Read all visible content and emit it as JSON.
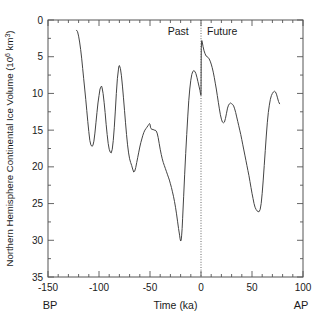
{
  "figure": {
    "name": "northern-hemisphere-ice-volume-figure",
    "background": "#ffffff",
    "line_color": "#444444",
    "axis_color": "#555555"
  },
  "chart_data": {
    "type": "line",
    "title": "",
    "subtitle": "",
    "xlabel": "Time (ka)",
    "ylabel": "Northern Hemisphere Continental Ice Volume (10⁶ km³)",
    "ylabel_base": "Northern Hemisphere Continental Ice Volume (10",
    "ylabel_exp": "6",
    "ylabel_tail": " km",
    "ylabel_exp2": "3",
    "ylabel_close": ")",
    "xlim": [
      -150,
      100
    ],
    "ylim": [
      35,
      0
    ],
    "y_inverted": true,
    "grid": false,
    "legend": null,
    "xticks": [
      -150,
      -100,
      -50,
      0,
      50,
      100
    ],
    "xtick_labels": [
      "-150",
      "-100",
      "-50",
      "0",
      "50",
      "100"
    ],
    "x_minor_step": 10,
    "yticks": [
      0,
      5,
      10,
      15,
      20,
      25,
      30,
      35
    ],
    "ytick_labels": [
      "0",
      "5",
      "10",
      "15",
      "20",
      "25",
      "30",
      "35"
    ],
    "y_minor_step": 2.5,
    "annotations": [
      {
        "name": "past-label",
        "text": "Past",
        "x": -12,
        "y": 1.5,
        "anchor": "end"
      },
      {
        "name": "future-label",
        "text": "Future",
        "x": 6,
        "y": 1.5,
        "anchor": "start"
      },
      {
        "name": "bp-label",
        "text": "BP",
        "x": -150,
        "y": null,
        "anchor": "middle"
      },
      {
        "name": "ap-label",
        "text": "AP",
        "x": 100,
        "y": null,
        "anchor": "middle"
      }
    ],
    "reference_lines": [
      {
        "name": "present-day-divider",
        "orientation": "vertical",
        "x": 0,
        "style": "dotted"
      }
    ],
    "corner_labels": {
      "left": "BP",
      "right": "AP"
    },
    "era_labels": {
      "past": "Past",
      "future": "Future"
    },
    "series": [
      {
        "name": "Northern Hemisphere continental ice volume",
        "segment": "past",
        "points": [
          [
            -122.0,
            1.4
          ],
          [
            -121.0,
            1.6
          ],
          [
            -120.0,
            2.2
          ],
          [
            -119.0,
            3.0
          ],
          [
            -118.0,
            4.0
          ],
          [
            -117.0,
            5.2
          ],
          [
            -116.0,
            6.6
          ],
          [
            -115.0,
            8.0
          ],
          [
            -114.0,
            9.4
          ],
          [
            -113.0,
            10.8
          ],
          [
            -112.0,
            12.3
          ],
          [
            -111.0,
            13.8
          ],
          [
            -110.0,
            15.2
          ],
          [
            -109.0,
            16.4
          ],
          [
            -108.0,
            17.0
          ],
          [
            -107.0,
            17.2
          ],
          [
            -106.0,
            17.1
          ],
          [
            -105.0,
            16.5
          ],
          [
            -104.0,
            15.4
          ],
          [
            -103.0,
            14.0
          ],
          [
            -102.0,
            12.6
          ],
          [
            -101.0,
            11.3
          ],
          [
            -100.0,
            10.3
          ],
          [
            -99.0,
            9.4
          ],
          [
            -98.0,
            9.1
          ],
          [
            -97.5,
            9.0
          ],
          [
            -97.0,
            9.2
          ],
          [
            -96.0,
            10.0
          ],
          [
            -95.0,
            11.2
          ],
          [
            -94.0,
            12.6
          ],
          [
            -93.0,
            14.2
          ],
          [
            -92.0,
            15.6
          ],
          [
            -91.0,
            16.8
          ],
          [
            -90.0,
            17.6
          ],
          [
            -89.0,
            18.0
          ],
          [
            -88.0,
            18.1
          ],
          [
            -87.0,
            17.6
          ],
          [
            -86.0,
            16.4
          ],
          [
            -85.0,
            14.6
          ],
          [
            -84.0,
            12.4
          ],
          [
            -83.0,
            10.0
          ],
          [
            -82.0,
            8.0
          ],
          [
            -81.0,
            6.8
          ],
          [
            -80.5,
            6.3
          ],
          [
            -80.0,
            6.2
          ],
          [
            -79.0,
            6.6
          ],
          [
            -78.0,
            7.6
          ],
          [
            -77.0,
            9.0
          ],
          [
            -76.0,
            10.6
          ],
          [
            -75.0,
            12.3
          ],
          [
            -74.0,
            14.0
          ],
          [
            -73.0,
            15.6
          ],
          [
            -72.0,
            17.0
          ],
          [
            -71.0,
            18.1
          ],
          [
            -70.0,
            18.9
          ],
          [
            -69.0,
            19.4
          ],
          [
            -68.0,
            19.8
          ],
          [
            -67.0,
            20.3
          ],
          [
            -66.0,
            20.7
          ],
          [
            -65.0,
            20.6
          ],
          [
            -64.0,
            20.1
          ],
          [
            -63.0,
            19.4
          ],
          [
            -62.0,
            18.7
          ],
          [
            -61.0,
            18.0
          ],
          [
            -60.0,
            17.3
          ],
          [
            -59.0,
            16.7
          ],
          [
            -58.0,
            16.2
          ],
          [
            -57.0,
            15.7
          ],
          [
            -56.0,
            15.3
          ],
          [
            -55.0,
            15.0
          ],
          [
            -54.0,
            14.8
          ],
          [
            -53.0,
            14.6
          ],
          [
            -52.0,
            14.4
          ],
          [
            -51.0,
            14.2
          ],
          [
            -50.5,
            14.1
          ],
          [
            -50.0,
            14.2
          ],
          [
            -49.5,
            14.6
          ],
          [
            -49.0,
            14.8
          ],
          [
            -48.0,
            14.9
          ],
          [
            -47.0,
            14.9
          ],
          [
            -46.0,
            15.0
          ],
          [
            -45.0,
            15.0
          ],
          [
            -44.0,
            15.1
          ],
          [
            -43.0,
            15.4
          ],
          [
            -42.0,
            16.0
          ],
          [
            -41.0,
            16.8
          ],
          [
            -40.0,
            17.6
          ],
          [
            -39.0,
            18.3
          ],
          [
            -38.0,
            18.9
          ],
          [
            -37.0,
            19.4
          ],
          [
            -36.0,
            19.8
          ],
          [
            -35.0,
            20.2
          ],
          [
            -34.0,
            20.6
          ],
          [
            -33.0,
            21.0
          ],
          [
            -32.0,
            21.4
          ],
          [
            -31.0,
            21.8
          ],
          [
            -30.0,
            22.3
          ],
          [
            -29.0,
            22.8
          ],
          [
            -28.0,
            23.4
          ],
          [
            -27.0,
            24.0
          ],
          [
            -26.0,
            24.7
          ],
          [
            -25.0,
            25.5
          ],
          [
            -24.0,
            26.4
          ],
          [
            -23.0,
            27.4
          ],
          [
            -22.0,
            28.4
          ],
          [
            -21.0,
            29.3
          ],
          [
            -20.5,
            29.8
          ],
          [
            -20.0,
            30.1
          ],
          [
            -19.5,
            30.0
          ],
          [
            -19.0,
            29.4
          ],
          [
            -18.5,
            28.4
          ],
          [
            -18.0,
            27.0
          ],
          [
            -17.0,
            24.0
          ],
          [
            -16.0,
            21.0
          ],
          [
            -15.0,
            18.2
          ],
          [
            -14.0,
            15.6
          ],
          [
            -13.0,
            13.2
          ],
          [
            -12.0,
            11.0
          ],
          [
            -11.0,
            9.4
          ],
          [
            -10.0,
            8.2
          ],
          [
            -9.0,
            7.4
          ],
          [
            -8.0,
            7.0
          ],
          [
            -7.0,
            6.9
          ],
          [
            -6.0,
            7.0
          ],
          [
            -5.0,
            7.3
          ],
          [
            -4.0,
            7.8
          ],
          [
            -3.0,
            8.4
          ],
          [
            -2.0,
            9.0
          ],
          [
            -1.0,
            9.6
          ],
          [
            -0.4,
            10.1
          ],
          [
            -0.2,
            10.2
          ]
        ]
      },
      {
        "name": "Northern Hemisphere continental ice volume",
        "segment": "future",
        "points": [
          [
            0.0,
            10.2
          ],
          [
            0.1,
            8.0
          ],
          [
            0.2,
            5.6
          ],
          [
            0.3,
            3.9
          ],
          [
            0.5,
            3.0
          ],
          [
            0.8,
            2.8
          ],
          [
            1.2,
            3.0
          ],
          [
            2.0,
            3.6
          ],
          [
            3.0,
            4.2
          ],
          [
            4.0,
            4.6
          ],
          [
            5.0,
            4.9
          ],
          [
            6.0,
            5.0
          ],
          [
            7.0,
            5.1
          ],
          [
            8.0,
            5.3
          ],
          [
            9.0,
            5.6
          ],
          [
            10.0,
            6.0
          ],
          [
            11.0,
            6.5
          ],
          [
            12.0,
            7.1
          ],
          [
            13.0,
            7.8
          ],
          [
            14.0,
            8.6
          ],
          [
            15.0,
            9.4
          ],
          [
            16.0,
            10.3
          ],
          [
            17.0,
            11.2
          ],
          [
            18.0,
            12.1
          ],
          [
            19.0,
            12.9
          ],
          [
            20.0,
            13.5
          ],
          [
            21.0,
            13.9
          ],
          [
            22.0,
            14.0
          ],
          [
            23.0,
            13.9
          ],
          [
            24.0,
            13.4
          ],
          [
            25.0,
            12.7
          ],
          [
            26.0,
            12.0
          ],
          [
            27.0,
            11.6
          ],
          [
            28.0,
            11.4
          ],
          [
            29.0,
            11.3
          ],
          [
            30.0,
            11.4
          ],
          [
            31.0,
            11.5
          ],
          [
            32.0,
            11.7
          ],
          [
            33.0,
            12.1
          ],
          [
            34.0,
            12.6
          ],
          [
            35.0,
            13.2
          ],
          [
            36.0,
            13.8
          ],
          [
            37.0,
            14.4
          ],
          [
            38.0,
            15.0
          ],
          [
            39.0,
            15.6
          ],
          [
            40.0,
            16.3
          ],
          [
            41.0,
            17.0
          ],
          [
            42.0,
            17.7
          ],
          [
            43.0,
            18.4
          ],
          [
            44.0,
            19.1
          ],
          [
            45.0,
            19.8
          ],
          [
            46.0,
            20.5
          ],
          [
            47.0,
            21.2
          ],
          [
            48.0,
            22.0
          ],
          [
            49.0,
            22.8
          ],
          [
            50.0,
            23.6
          ],
          [
            51.0,
            24.3
          ],
          [
            52.0,
            25.0
          ],
          [
            53.0,
            25.5
          ],
          [
            54.0,
            25.8
          ],
          [
            55.0,
            26.0
          ],
          [
            56.0,
            26.1
          ],
          [
            57.0,
            26.1
          ],
          [
            58.0,
            25.8
          ],
          [
            59.0,
            25.0
          ],
          [
            60.0,
            23.6
          ],
          [
            61.0,
            21.8
          ],
          [
            62.0,
            19.8
          ],
          [
            63.0,
            17.8
          ],
          [
            64.0,
            15.8
          ],
          [
            65.0,
            14.0
          ],
          [
            66.0,
            12.6
          ],
          [
            67.0,
            11.6
          ],
          [
            68.0,
            10.8
          ],
          [
            69.0,
            10.3
          ],
          [
            70.0,
            10.0
          ],
          [
            71.0,
            9.8
          ],
          [
            72.0,
            9.7
          ],
          [
            73.0,
            9.8
          ],
          [
            74.0,
            10.1
          ],
          [
            75.0,
            10.6
          ],
          [
            76.0,
            11.1
          ],
          [
            77.0,
            11.4
          ]
        ]
      }
    ]
  }
}
